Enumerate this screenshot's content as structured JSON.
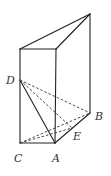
{
  "figure": {
    "type": "geometry-prism",
    "colors": {
      "line": "#222222",
      "label": "#333333",
      "background": "#ffffff"
    },
    "points": {
      "T": {
        "x": 90,
        "y": 14
      },
      "D1": {
        "x": 20,
        "y": 49
      },
      "A1": {
        "x": 56,
        "y": 49
      },
      "D": {
        "x": 20,
        "y": 80
      },
      "B": {
        "x": 90,
        "y": 113
      },
      "E": {
        "x": 72,
        "y": 128
      },
      "C": {
        "x": 20,
        "y": 143
      },
      "A": {
        "x": 55,
        "y": 143
      }
    },
    "labels": {
      "D": "D",
      "B": "B",
      "E": "E",
      "C": "C",
      "A": "A"
    },
    "solid_edges": [
      [
        "T",
        "D1"
      ],
      [
        "T",
        "A1"
      ],
      [
        "D1",
        "A1"
      ],
      [
        "T",
        "B"
      ],
      [
        "D1",
        "C"
      ],
      [
        "A1",
        "A"
      ],
      [
        "C",
        "A"
      ],
      [
        "A",
        "B"
      ],
      [
        "D",
        "A"
      ]
    ],
    "dashed_edges": [
      [
        "D",
        "B"
      ],
      [
        "D",
        "E"
      ],
      [
        "C",
        "B"
      ],
      [
        "C",
        "E"
      ]
    ]
  }
}
